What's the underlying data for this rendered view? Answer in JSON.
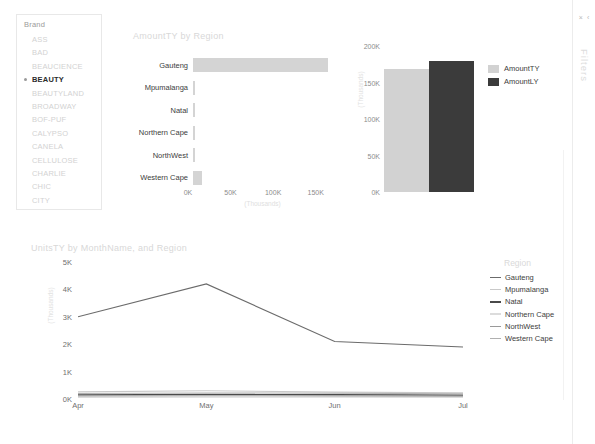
{
  "slicer": {
    "title": "Brand",
    "items": [
      {
        "label": "ASS",
        "selected": false
      },
      {
        "label": "BAD",
        "selected": false
      },
      {
        "label": "BEAUCIENCE",
        "selected": false
      },
      {
        "label": "BEAUTY",
        "selected": true
      },
      {
        "label": "BEAUTYLAND",
        "selected": false
      },
      {
        "label": "BROADWAY",
        "selected": false
      },
      {
        "label": "BOF-PUF",
        "selected": false
      },
      {
        "label": "CALYPSO",
        "selected": false
      },
      {
        "label": "CANELA",
        "selected": false
      },
      {
        "label": "CELLULOSE",
        "selected": false
      },
      {
        "label": "CHARLIE",
        "selected": false
      },
      {
        "label": "CHIC",
        "selected": false
      },
      {
        "label": "CITY",
        "selected": false
      }
    ]
  },
  "filters_pane": {
    "label": "Filters",
    "close_icon": "×",
    "expand_icon": "‹"
  },
  "colors": {
    "amount_ty": "#d2d2d2",
    "amount_ly": "#3b3b3b",
    "bar_fill": "#d4d4d4",
    "line_gauteng": "#6b6b6b",
    "line_mpumalanga": "#c9c9c9",
    "line_natal": "#4a4a4a",
    "line_northern_cape": "#dcdcdc",
    "line_northwest": "#9a9a9a",
    "line_western_cape": "#b0b0b0"
  },
  "chart_data": [
    {
      "type": "bar",
      "orientation": "horizontal",
      "title": "AmountTY by Region",
      "categories": [
        "Gauteng",
        "Mpumalanga",
        "Natal",
        "Northern Cape",
        "NorthWest",
        "Western Cape"
      ],
      "values": [
        158000,
        1200,
        1800,
        700,
        900,
        10500
      ],
      "xlabel": "(Thousands)",
      "ylabel": "",
      "xlim": [
        0,
        175000
      ],
      "ticks": [
        "0K",
        "50K",
        "100K",
        "150K"
      ],
      "tick_values": [
        0,
        50000,
        100000,
        150000
      ],
      "grid": false
    },
    {
      "type": "bar",
      "orientation": "vertical",
      "title": "",
      "categories": [
        "AmountTY",
        "AmountLY"
      ],
      "values": [
        168000,
        180000
      ],
      "xlabel": "",
      "ylabel": "(Thousands)",
      "ylim": [
        0,
        200000
      ],
      "ticks": [
        "0K",
        "50K",
        "100K",
        "150K",
        "200K"
      ],
      "tick_values": [
        0,
        50000,
        100000,
        150000,
        200000
      ],
      "legend": [
        "AmountTY",
        "AmountLY"
      ],
      "legend_position": "right",
      "grid": false
    },
    {
      "type": "line",
      "title": "UnitsTY by MonthName, and Region",
      "x": [
        "Apr",
        "May",
        "Jun",
        "Jul"
      ],
      "xlabel": "",
      "ylabel": "(Thousands)",
      "ylim": [
        0,
        5000
      ],
      "ticks": [
        "0K",
        "1K",
        "2K",
        "3K",
        "4K",
        "5K"
      ],
      "tick_values": [
        0,
        1000,
        2000,
        3000,
        4000,
        5000
      ],
      "legend_title": "Region",
      "legend_position": "right",
      "grid": false,
      "series": [
        {
          "name": "Gauteng",
          "values": [
            3000,
            4200,
            2100,
            1900
          ]
        },
        {
          "name": "Mpumalanga",
          "values": [
            260,
            300,
            250,
            230
          ]
        },
        {
          "name": "Natal",
          "values": [
            150,
            170,
            160,
            140
          ]
        },
        {
          "name": "Northern Cape",
          "values": [
            60,
            70,
            65,
            55
          ]
        },
        {
          "name": "NorthWest",
          "values": [
            110,
            120,
            115,
            100
          ]
        },
        {
          "name": "Western Cape",
          "values": [
            200,
            220,
            210,
            190
          ]
        }
      ]
    }
  ]
}
